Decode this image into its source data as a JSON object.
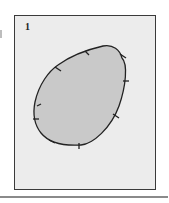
{
  "figure": {
    "label": "1",
    "shape": "teardrop",
    "fill_color": "#c9c9c9",
    "outline_color": "#222222",
    "frame_background": "#ececec",
    "tick_count": 9
  }
}
